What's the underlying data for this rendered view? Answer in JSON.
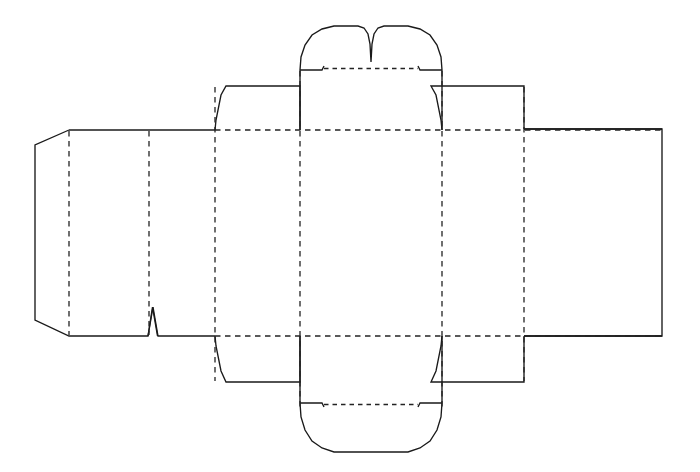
{
  "document": {
    "title": "Carton Dieline Layout",
    "description": "Flat packaging die-cut template (tuck-end carton blank) drawn as black cut lines with dashed fold/crease lines.",
    "canvas": {
      "width": 700,
      "height": 472,
      "background": "#ffffff"
    }
  },
  "style": {
    "cut_line_color": "#1a1a1a",
    "crease_line_color": "#232323",
    "cut_line_width": 1.35,
    "crease_line_width": 1.3,
    "crease_dash_pattern": "5.5 4.5"
  },
  "geometry": {
    "body_top_y": 130,
    "body_bottom_y": 336,
    "glue_flap_left_x": 35,
    "right_edge_x": 662,
    "vertical_creases_x": [
      69,
      149,
      215,
      300,
      442,
      524
    ],
    "horizontal_creases_y": [
      130,
      336
    ]
  },
  "parts": {
    "glue_flap": {
      "name": "glue-flap",
      "label": "Glue flap",
      "outline": "M 69 130 L 35 145 L 35 320 L 69 336",
      "crease_x": 69
    },
    "back_panel": {
      "name": "back-panel",
      "label": "Back panel",
      "left_x": 69,
      "right_x": 149
    },
    "side_panel_left": {
      "name": "left-side-panel",
      "label": "Left side panel",
      "left_x": 149,
      "right_x": 215
    },
    "front_panel": {
      "name": "front-panel",
      "label": "Front panel",
      "left_x": 215,
      "right_x": 442
    },
    "side_panel_right": {
      "name": "right-side-panel",
      "label": "Right side panel",
      "left_x": 442,
      "right_x": 524
    },
    "back_panel_right": {
      "name": "rear-panel",
      "label": "Rear panel",
      "left_x": 524,
      "right_x": 662
    },
    "top_tuck_flap": {
      "name": "top-tuck-flap",
      "label": "Top tuck flap with double-lobe tab",
      "left_x": 300,
      "right_x": 442,
      "base_y": 130,
      "fold_y": 70,
      "tab_top_y": 26,
      "lobe_count": 2,
      "notch_center_x": 371
    },
    "bottom_tuck_flap": {
      "name": "bottom-tuck-flap",
      "label": "Bottom tuck flap with rounded tab",
      "left_x": 300,
      "right_x": 442,
      "base_y": 336,
      "fold_y": 409,
      "tab_bottom_y": 452
    },
    "top_dust_flap_left": {
      "name": "top-left-dust-flap",
      "label": "Top left dust flap",
      "left_x": 215,
      "right_x": 300,
      "top_y": 86,
      "base_y": 130
    },
    "top_dust_flap_right": {
      "name": "top-right-dust-flap",
      "label": "Top right dust flap",
      "left_x": 442,
      "right_x": 524,
      "top_y": 86,
      "base_y": 130
    },
    "bottom_dust_flap_left": {
      "name": "bottom-left-dust-flap",
      "label": "Bottom left dust flap",
      "left_x": 215,
      "right_x": 300,
      "base_y": 336,
      "bottom_y": 382
    },
    "bottom_dust_flap_right": {
      "name": "bottom-right-dust-flap",
      "label": "Bottom right dust flap",
      "left_x": 442,
      "right_x": 524,
      "base_y": 336,
      "bottom_y": 382
    },
    "nick_notch": {
      "name": "bottom-edge-nick-notch",
      "label": "V nick notch on bottom edge",
      "left_x": 148,
      "apex_x": 153,
      "right_x": 158,
      "apex_y": 307,
      "base_y": 336
    }
  },
  "paths": {
    "main_outline": "M 69 130 L 35 145 L 35 320 L 69 336 L 148 336 L 153 307 L 158 336 L 215 336 L 215 382 L 300 382 L 300 336 L 300 336 L 300 409 L 302 423 L 309 438 L 322 448 L 338 452 L 404 452 L 420 448 L 433 438 L 440 423 L 442 409 L 442 336 L 442 382 L 524 382 L 524 336 L 662 336 L 662 129 L 524 129 L 524 86 L 442 86 L 442 130 L 442 70 L 440 55 L 433 40 L 420 30 L 404 26 L 378 26 L 373 30 L 371 40 L 371 62 L 371 40 L 369 30 L 364 26 L 338 26 L 322 30 L 309 40 L 302 55 L 300 70 L 300 130 L 300 86 L 215 86 L 215 130 Z",
    "outer_cut": "M 69 130 L 35 145 L 35 320 L 69 336 L 148 336 L 153 307 L 158 336 L 215 336",
    "top_left_dust": "M 215 130 L 216 120 L 221 95 L 226 86 L 300 86 L 300 130",
    "top_right_dust": "M 442 130 L 441 120 L 436 95 L 431 86 L 524 86 L 524 129",
    "bottom_left_dust": "M 215 336 L 216 346 L 221 371 L 226 382 L 300 382 L 300 336",
    "bottom_right_dust": "M 442 336 L 441 346 L 436 371 L 431 382 L 524 382 L 524 336",
    "top_tuck": "M 300 130 L 300 70 L 301 57 L 305 45 L 312 35 L 322 29 L 334 26 L 358 26 L 364 28 L 368 34 L 370 44 L 371 62 L 372 44 L 374 34 L 378 28 L 384 26 L 408 26 L 420 29 L 430 35 L 437 45 L 441 57 L 442 70 L 442 130",
    "bottom_tuck": "M 300 336 L 300 403 L 301 417 L 305 430 L 312 441 L 322 448 L 334 452 L 408 452 L 420 448 L 430 441 L 437 430 L 441 417 L 442 403 L 442 336",
    "right_panel": "M 524 129 L 662 129 L 662 336 L 524 336",
    "top_tuck_step_left": "M 300 70 L 322 70 L 324 66",
    "top_tuck_step_right": "M 442 70 L 420 70 L 418 66",
    "bottom_tuck_step_left": "M 300 403 L 322 403 L 324 407",
    "bottom_tuck_step_right": "M 442 403 L 420 403 L 418 407"
  },
  "creases": {
    "vertical": [
      {
        "name": "crease-glue-flap",
        "x": 69,
        "y1": 130,
        "y2": 336
      },
      {
        "name": "crease-back-side",
        "x": 149,
        "y1": 130,
        "y2": 336
      },
      {
        "name": "crease-side-front",
        "x": 215,
        "y1": 86,
        "y2": 382
      },
      {
        "name": "crease-front-left",
        "x": 300,
        "y1": 70,
        "y2": 409
      },
      {
        "name": "crease-front-right",
        "x": 442,
        "y1": 70,
        "y2": 409
      },
      {
        "name": "crease-side-rear",
        "x": 524,
        "y1": 86,
        "y2": 382
      }
    ],
    "horizontal": [
      {
        "name": "crease-top-body",
        "x1": 215,
        "x2": 662,
        "y": 130
      },
      {
        "name": "crease-bottom-body",
        "x1": 215,
        "x2": 662,
        "y": 336
      },
      {
        "name": "crease-top-tuck-tab",
        "x1": 322,
        "x2": 420,
        "y": 70
      },
      {
        "name": "crease-bottom-tuck-tab",
        "x1": 322,
        "x2": 420,
        "y": 403
      }
    ]
  }
}
